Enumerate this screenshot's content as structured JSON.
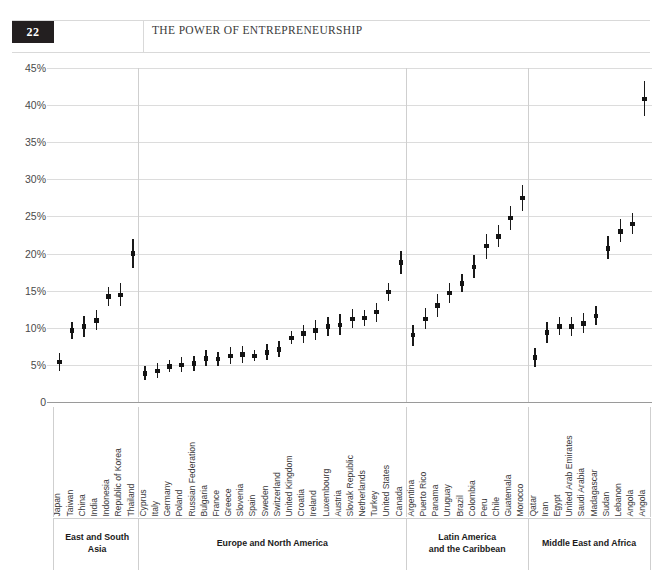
{
  "page": {
    "folio": "22",
    "running_head": "THE POWER OF ENTREPRENEURSHIP"
  },
  "chart_data": {
    "type": "scatter",
    "title": "",
    "subtitle": "",
    "xlabel": "",
    "ylabel": "",
    "ylim": [
      0,
      45
    ],
    "ytick_labels": [
      "45%",
      "40%",
      "35%",
      "30%",
      "25%",
      "20%",
      "15%",
      "10%",
      "5%",
      "0"
    ],
    "ytick_values": [
      45,
      40,
      35,
      30,
      25,
      20,
      15,
      10,
      5,
      0
    ],
    "grid": true,
    "legend": "none",
    "marker": "square point with vertical range bar",
    "groups": [
      {
        "name": "East and South Asia",
        "points": [
          {
            "label": "Japan",
            "value": 5.4,
            "low": 4.2,
            "high": 6.6
          },
          {
            "label": "Taiwan",
            "value": 9.6,
            "low": 8.5,
            "high": 10.8
          },
          {
            "label": "China",
            "value": 10.2,
            "low": 8.8,
            "high": 11.6
          },
          {
            "label": "India",
            "value": 11.0,
            "low": 9.7,
            "high": 12.4
          },
          {
            "label": "Indonesia",
            "value": 14.2,
            "low": 13.0,
            "high": 15.5
          },
          {
            "label": "Republic of Korea",
            "value": 14.4,
            "low": 12.9,
            "high": 16.0
          },
          {
            "label": "Thailand",
            "value": 20.0,
            "low": 18.1,
            "high": 22.0
          }
        ]
      },
      {
        "name": "Europe and North America",
        "points": [
          {
            "label": "Cyprus",
            "value": 3.8,
            "low": 2.9,
            "high": 4.8
          },
          {
            "label": "Italy",
            "value": 4.2,
            "low": 3.2,
            "high": 5.2
          },
          {
            "label": "Germany",
            "value": 4.8,
            "low": 4.1,
            "high": 5.6
          },
          {
            "label": "Poland",
            "value": 5.0,
            "low": 4.0,
            "high": 6.0
          },
          {
            "label": "Russian Federation",
            "value": 5.2,
            "low": 4.2,
            "high": 6.2
          },
          {
            "label": "Bulgaria",
            "value": 5.9,
            "low": 4.8,
            "high": 7.0
          },
          {
            "label": "France",
            "value": 5.8,
            "low": 4.9,
            "high": 6.8
          },
          {
            "label": "Greece",
            "value": 6.2,
            "low": 5.1,
            "high": 7.4
          },
          {
            "label": "Slovenia",
            "value": 6.4,
            "low": 5.3,
            "high": 7.5
          },
          {
            "label": "Spain",
            "value": 6.2,
            "low": 5.5,
            "high": 7.0
          },
          {
            "label": "Sweden",
            "value": 6.7,
            "low": 5.7,
            "high": 7.8
          },
          {
            "label": "Switzerland",
            "value": 7.1,
            "low": 6.0,
            "high": 8.2
          },
          {
            "label": "United Kingdom",
            "value": 8.6,
            "low": 7.8,
            "high": 9.5
          },
          {
            "label": "Croatia",
            "value": 9.2,
            "low": 8.0,
            "high": 10.4
          },
          {
            "label": "Ireland",
            "value": 9.6,
            "low": 8.3,
            "high": 11.0
          },
          {
            "label": "Luxembourg",
            "value": 10.2,
            "low": 8.9,
            "high": 11.5
          },
          {
            "label": "Austria",
            "value": 10.4,
            "low": 9.0,
            "high": 11.8
          },
          {
            "label": "Slovak Republic",
            "value": 11.2,
            "low": 10.0,
            "high": 12.5
          },
          {
            "label": "Netherlands",
            "value": 11.3,
            "low": 10.2,
            "high": 12.4
          },
          {
            "label": "Turkey",
            "value": 12.1,
            "low": 10.8,
            "high": 13.4
          },
          {
            "label": "United States",
            "value": 14.8,
            "low": 13.6,
            "high": 16.0
          },
          {
            "label": "Canada",
            "value": 18.8,
            "low": 17.3,
            "high": 20.3
          }
        ]
      },
      {
        "name": "Latin America and the Caribbean",
        "region_label_line1": "Latin America",
        "region_label_line2": "and the Caribbean",
        "points": [
          {
            "label": "Argentina",
            "value": 9.0,
            "low": 7.6,
            "high": 10.4
          },
          {
            "label": "Puerto Rico",
            "value": 11.2,
            "low": 9.9,
            "high": 12.6
          },
          {
            "label": "Panama",
            "value": 13.0,
            "low": 11.4,
            "high": 14.6
          },
          {
            "label": "Uruguay",
            "value": 14.7,
            "low": 13.3,
            "high": 16.1
          },
          {
            "label": "Brazil",
            "value": 16.0,
            "low": 14.8,
            "high": 17.3
          },
          {
            "label": "Colombia",
            "value": 18.2,
            "low": 16.7,
            "high": 19.8
          },
          {
            "label": "Peru",
            "value": 21.0,
            "low": 19.3,
            "high": 22.6
          },
          {
            "label": "Chile",
            "value": 22.3,
            "low": 20.9,
            "high": 23.8
          },
          {
            "label": "Guatemala",
            "value": 24.8,
            "low": 23.2,
            "high": 26.4
          },
          {
            "label": "Morocco",
            "value": 27.5,
            "low": 25.8,
            "high": 29.2
          }
        ]
      },
      {
        "name": "Middle East and Africa",
        "points": [
          {
            "label": "Qatar",
            "value": 6.0,
            "low": 4.7,
            "high": 7.3
          },
          {
            "label": "Iran",
            "value": 9.4,
            "low": 8.0,
            "high": 10.8
          },
          {
            "label": "Egypt",
            "value": 10.2,
            "low": 9.0,
            "high": 11.4
          },
          {
            "label": "United Arab Emirates",
            "value": 10.2,
            "low": 8.9,
            "high": 11.5
          },
          {
            "label": "Saudi Arabia",
            "value": 10.6,
            "low": 9.3,
            "high": 12.0
          },
          {
            "label": "Madagascar",
            "value": 11.6,
            "low": 10.4,
            "high": 12.9
          },
          {
            "label": "Sudan",
            "value": 20.7,
            "low": 19.2,
            "high": 22.3
          },
          {
            "label": "Lebanon",
            "value": 23.0,
            "low": 21.5,
            "high": 24.6
          },
          {
            "label": "Angola",
            "value": 24.0,
            "low": 22.6,
            "high": 25.4
          },
          {
            "label": "Angola ",
            "value": 40.8,
            "low": 38.6,
            "high": 43.2
          }
        ]
      }
    ]
  },
  "style": {
    "ink": "#141414",
    "grid": "#dcdcdc",
    "axis": "#9a9a9a"
  }
}
